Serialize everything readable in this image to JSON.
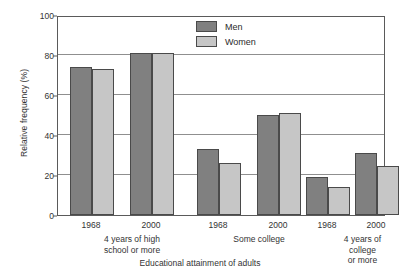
{
  "chart_data": {
    "type": "bar",
    "title": "",
    "xlabel": "Educational attainment of adults",
    "ylabel": "Relative frequency (%)",
    "ylim": [
      0,
      100
    ],
    "yticks": [
      0,
      20,
      40,
      60,
      80,
      100
    ],
    "grid": true,
    "legend_position": "top-center",
    "categories": [
      "4 years of high school or more — 1968",
      "4 years of high school or more — 2000",
      "Some college — 1968",
      "Some college — 2000",
      "4 years of college or more — 1968",
      "4 years of college or more — 2000"
    ],
    "groups": [
      {
        "label": "4 years of high\nschool or more",
        "years": [
          "1968",
          "2000"
        ]
      },
      {
        "label": "Some college",
        "years": [
          "1968",
          "2000"
        ]
      },
      {
        "label": "4 years of college\nor more",
        "years": [
          "1968",
          "2000"
        ]
      }
    ],
    "series": [
      {
        "name": "Men",
        "color": "#808080",
        "values": [
          74,
          81,
          33,
          50,
          19,
          31
        ]
      },
      {
        "name": "Women",
        "color": "#c6c6c6",
        "values": [
          73,
          81,
          26,
          51,
          14,
          24.5
        ]
      }
    ]
  },
  "axes": {
    "y_title": "Relative frequency (%)",
    "x_title": "Educational attainment of adults",
    "y_tick_labels": [
      "0",
      "20",
      "40",
      "60",
      "80",
      "100"
    ]
  },
  "legend": {
    "items": [
      {
        "label": "Men",
        "swatch": "men-swatch"
      },
      {
        "label": "Women",
        "swatch": "women-swatch"
      }
    ]
  },
  "x_labels": {
    "years": [
      "1968",
      "2000",
      "1968",
      "2000",
      "1968",
      "2000"
    ],
    "groups": [
      "4 years of high\nschool or more",
      "Some college",
      "4 years of college\nor more"
    ]
  }
}
